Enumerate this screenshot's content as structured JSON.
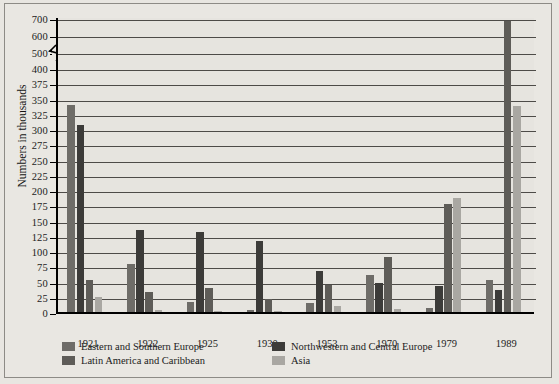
{
  "chart_data": {
    "type": "bar",
    "title": "",
    "subtitle": "",
    "xlabel": "",
    "ylabel": "Numbers in thousands",
    "categories": [
      "1921",
      "1922",
      "1925",
      "1930",
      "1953",
      "1970",
      "1979",
      "1989"
    ],
    "series": [
      {
        "name": "Eastern and Southern Europe",
        "color": "#6e6c68",
        "values": [
          340,
          78,
          17,
          4,
          15,
          60,
          6,
          52
        ]
      },
      {
        "name": "Northwestern and Central Europe",
        "color": "#3c3b39",
        "values": [
          307,
          134,
          131,
          117,
          68,
          47,
          42,
          36
        ]
      },
      {
        "name": "Latin America and Caribbean",
        "color": "#5e5c58",
        "values": [
          52,
          33,
          40,
          21,
          44,
          90,
          177,
          680
        ]
      },
      {
        "name": "Asia",
        "color": "#a9a7a2",
        "values": [
          25,
          4,
          2,
          2,
          10,
          5,
          187,
          337
        ]
      }
    ],
    "ylim": [
      0,
      700
    ],
    "y_ticks_lower": [
      0,
      25,
      50,
      75,
      100,
      125,
      150,
      175,
      200,
      225,
      250,
      275,
      300,
      325,
      350,
      375,
      400
    ],
    "y_ticks_upper": [
      500,
      600,
      700
    ],
    "axis_break": {
      "between": [
        400,
        500
      ],
      "present": true
    },
    "gridlines": true,
    "legend_position": "bottom-left"
  },
  "legend": {
    "entries": [
      {
        "label": "Eastern and Southern Europe",
        "color": "#6e6c68"
      },
      {
        "label": "Northwestern and Central Europe",
        "color": "#3c3b39"
      },
      {
        "label": "Latin America and Caribbean",
        "color": "#5e5c58"
      },
      {
        "label": "Asia",
        "color": "#a9a7a2"
      }
    ]
  }
}
